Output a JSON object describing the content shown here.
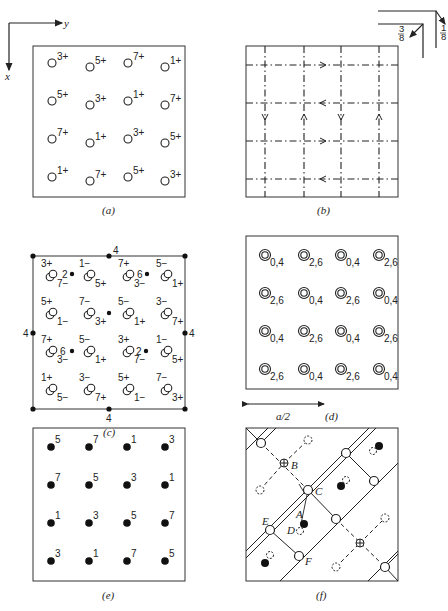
{
  "axes": {
    "x_label": "x",
    "y_label": "y"
  },
  "symmetry_legend": {
    "quarter": "1/4",
    "three_eighths": "3/8",
    "one_eighth": "1/8",
    "top_frac": "1",
    "bot_frac": "8",
    "top_frac2": "3",
    "bot_frac2": "8"
  },
  "panels": {
    "a": {
      "caption": "(a)",
      "atoms": [
        [
          "3+",
          "5+",
          "7+",
          "1+"
        ],
        [
          "5+",
          "3+",
          "1+",
          "7+"
        ],
        [
          "7+",
          "1+",
          "3+",
          "5+"
        ],
        [
          "1+",
          "7+",
          "5+",
          "3+"
        ]
      ]
    },
    "b": {
      "caption": "(b)"
    },
    "c": {
      "caption": "(c)",
      "axis_label": "4",
      "points_2": "2",
      "points_6": "6",
      "pairs": [
        {
          "a": "3+",
          "b": "7−"
        },
        {
          "a": "1−",
          "b": "5+"
        },
        {
          "a": "7+",
          "b": "3−"
        },
        {
          "a": "5−",
          "b": "1+"
        },
        {
          "a": "5+",
          "b": "1−"
        },
        {
          "a": "7−",
          "b": "3+"
        },
        {
          "a": "5−",
          "b": "1+"
        },
        {
          "a": "3−",
          "b": "7+"
        },
        {
          "a": "7+",
          "b": "3−"
        },
        {
          "a": "5−",
          "b": "1+"
        },
        {
          "a": "3+",
          "b": "7−"
        },
        {
          "a": "1−",
          "b": "5+"
        },
        {
          "a": "1+",
          "b": "5−"
        },
        {
          "a": "3−",
          "b": "7+"
        },
        {
          "a": "5+",
          "b": "1−"
        },
        {
          "a": "7−",
          "b": "3+"
        }
      ]
    },
    "d": {
      "caption": "(d)",
      "scale_label": "a/2",
      "atoms": [
        [
          "0,4",
          "2,6",
          "0,4",
          "2,6"
        ],
        [
          "2,6",
          "0,4",
          "2,6",
          "0,4"
        ],
        [
          "0,4",
          "2,6",
          "0,4",
          "2,6"
        ],
        [
          "2,6",
          "0,4",
          "2,6",
          "0,4"
        ]
      ]
    },
    "e": {
      "caption": "(e)",
      "atoms": [
        [
          "5",
          "7",
          "1",
          "3"
        ],
        [
          "7",
          "5",
          "3",
          "1"
        ],
        [
          "1",
          "3",
          "5",
          "7"
        ],
        [
          "3",
          "1",
          "7",
          "5"
        ]
      ]
    },
    "f": {
      "caption": "(f)",
      "labels": {
        "A": "A",
        "B": "B",
        "C": "C",
        "D": "D",
        "E": "E",
        "F": "F"
      }
    }
  }
}
